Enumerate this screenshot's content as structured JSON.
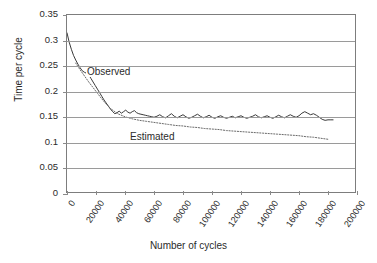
{
  "chart_data": {
    "type": "line",
    "title": "",
    "xlabel": "Number of cycles",
    "ylabel": "Time per cycle",
    "xlim": [
      0,
      200000
    ],
    "ylim": [
      0,
      0.35
    ],
    "grid": true,
    "grid_axis": "y",
    "legend": "inline-annotations",
    "xticks": [
      0,
      20000,
      40000,
      60000,
      80000,
      100000,
      120000,
      140000,
      160000,
      180000,
      200000
    ],
    "xticklabels": [
      "0",
      "20000",
      "40000",
      "60000",
      "80000",
      "100000",
      "120000",
      "140000",
      "160000",
      "180000",
      "200000"
    ],
    "yticks": [
      0,
      0.05,
      0.1,
      0.15,
      0.2,
      0.25,
      0.3,
      0.35
    ],
    "yticklabels": [
      "0",
      "0.05",
      "0.1",
      "0.15",
      "0.2",
      "0.25",
      "0.3",
      "0.35"
    ],
    "annotations": [
      {
        "text": "Observed",
        "x": 13000,
        "y": 0.238
      },
      {
        "text": "Estimated",
        "x": 42000,
        "y": 0.112
      }
    ],
    "series": [
      {
        "name": "Observed",
        "style": "solid",
        "color": "#3a3a3a",
        "x": [
          0,
          1500,
          3000,
          4500,
          6000,
          7500,
          9000,
          10500,
          12000,
          13500,
          15000,
          16500,
          18000,
          19500,
          21000,
          22500,
          24000,
          25500,
          27000,
          28500,
          30000,
          31500,
          33000,
          34500,
          36000,
          37500,
          39000,
          40500,
          42000,
          43500,
          45000,
          46500,
          48000,
          49500,
          51000,
          52500,
          54000,
          55500,
          57000,
          58500,
          60000,
          62000,
          64000,
          66000,
          68000,
          70000,
          72000,
          74000,
          76000,
          78000,
          80000,
          82000,
          84000,
          86000,
          88000,
          90000,
          92000,
          94000,
          96000,
          98000,
          100000,
          102000,
          104000,
          106000,
          108000,
          110000,
          112000,
          114000,
          116000,
          118000,
          120000,
          122000,
          124000,
          126000,
          128000,
          130000,
          132000,
          134000,
          136000,
          138000,
          140000,
          142000,
          144000,
          146000,
          148000,
          150000,
          152000,
          154000,
          156000,
          158000,
          160000,
          162000,
          164000,
          166000,
          168000,
          170000,
          172000,
          174000,
          176000,
          178000,
          180000,
          182000,
          183500
        ],
        "y": [
          0.315,
          0.297,
          0.283,
          0.271,
          0.262,
          0.254,
          0.247,
          0.241,
          0.238,
          0.236,
          0.233,
          0.226,
          0.219,
          0.212,
          0.205,
          0.198,
          0.191,
          0.184,
          0.178,
          0.172,
          0.166,
          0.161,
          0.157,
          0.159,
          0.162,
          0.158,
          0.161,
          0.164,
          0.16,
          0.158,
          0.161,
          0.163,
          0.159,
          0.157,
          0.156,
          0.155,
          0.154,
          0.153,
          0.152,
          0.151,
          0.15,
          0.152,
          0.155,
          0.151,
          0.149,
          0.153,
          0.157,
          0.152,
          0.149,
          0.152,
          0.155,
          0.151,
          0.148,
          0.15,
          0.153,
          0.156,
          0.152,
          0.149,
          0.151,
          0.154,
          0.15,
          0.148,
          0.151,
          0.153,
          0.15,
          0.148,
          0.15,
          0.152,
          0.149,
          0.151,
          0.153,
          0.15,
          0.148,
          0.15,
          0.152,
          0.155,
          0.151,
          0.149,
          0.151,
          0.153,
          0.15,
          0.148,
          0.151,
          0.154,
          0.151,
          0.149,
          0.152,
          0.155,
          0.152,
          0.15,
          0.153,
          0.158,
          0.161,
          0.158,
          0.155,
          0.157,
          0.154,
          0.15,
          0.146,
          0.144,
          0.145,
          0.145,
          0.145
        ]
      },
      {
        "name": "Estimated",
        "style": "dotted",
        "color": "#6a6a6a",
        "x": [
          6000,
          9000,
          12000,
          15000,
          18000,
          21000,
          24000,
          27000,
          30000,
          35000,
          40000,
          45000,
          50000,
          55000,
          60000,
          65000,
          70000,
          75000,
          80000,
          85000,
          90000,
          95000,
          100000,
          105000,
          110000,
          115000,
          120000,
          125000,
          130000,
          135000,
          140000,
          145000,
          150000,
          155000,
          160000,
          165000,
          170000,
          175000,
          180000
        ],
        "y": [
          0.256,
          0.243,
          0.231,
          0.219,
          0.208,
          0.197,
          0.186,
          0.176,
          0.167,
          0.157,
          0.151,
          0.147,
          0.144,
          0.142,
          0.14,
          0.138,
          0.136,
          0.134,
          0.133,
          0.131,
          0.13,
          0.128,
          0.127,
          0.126,
          0.124,
          0.123,
          0.122,
          0.121,
          0.12,
          0.119,
          0.118,
          0.117,
          0.116,
          0.115,
          0.114,
          0.112,
          0.111,
          0.109,
          0.107
        ]
      }
    ]
  }
}
